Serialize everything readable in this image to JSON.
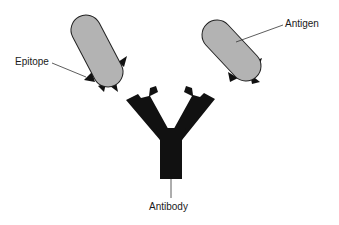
{
  "diagram": {
    "labels": {
      "epitope": "Epitope",
      "antigen": "Antigen",
      "antibody": "Antibody"
    },
    "colors": {
      "antigen_fill": "#b3b3b3",
      "antigen_stroke": "#222222",
      "epitope_fill": "#111111",
      "antibody_fill": "#111111",
      "leader_line": "#333333",
      "background": "#ffffff"
    },
    "elements": [
      {
        "id": "antigen-left",
        "type": "antigen",
        "has_epitopes": true
      },
      {
        "id": "antigen-right",
        "type": "antigen",
        "has_epitopes": true
      },
      {
        "id": "antibody",
        "type": "Y-shaped antibody"
      }
    ]
  }
}
